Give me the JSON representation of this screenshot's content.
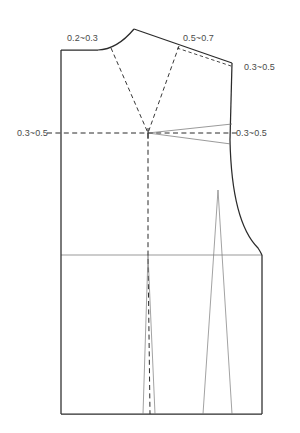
{
  "diagram": {
    "type": "sewing-pattern-technical-drawing",
    "units": "cm",
    "line_colors": {
      "outline": "#2b2b2b",
      "construction_dashed": "#2b2b2b",
      "dart_light": "#7a7a7a",
      "annotation_text": "#4a4a4a",
      "background": "#ffffff"
    }
  },
  "annotations": [
    {
      "id": "neck-shoulder-ease",
      "label": "0.2~0.3",
      "x": 67,
      "y": 41,
      "anchor": "start",
      "describes": "back neckline / shoulder adjustment amount"
    },
    {
      "id": "shoulder-dart-intake",
      "label": "0.5~0.7",
      "x": 183,
      "y": 41,
      "anchor": "start",
      "describes": "shoulder seam dart intake amount"
    },
    {
      "id": "shoulder-tip-drop",
      "label": "0.3~0.5",
      "x": 244,
      "y": 70,
      "anchor": "start",
      "describes": "shoulder tip lowering amount"
    },
    {
      "id": "left-bust-line-ease",
      "label": "0.3~0.5",
      "x": 17,
      "y": 136,
      "anchor": "start",
      "describes": "center front bust line adjustment"
    },
    {
      "id": "right-bust-dart-intake",
      "label": "0.3~0.5",
      "x": 236,
      "y": 136,
      "anchor": "start",
      "describes": "side seam bust dart intake"
    }
  ],
  "geometry": {
    "bodice_outline": "M 61,50 L 61,255 L 61,414 L 262,414 L 262,255",
    "center_back_x": 61,
    "waist_line_y": 255,
    "hem_line_y": 414,
    "right_side_x": 262,
    "shoulder_apex": {
      "x": 134,
      "y": 29
    },
    "shoulder_tip": {
      "x": 232,
      "y": 63
    },
    "bust_point": {
      "x": 148,
      "y": 133
    },
    "bust_line_y": 133,
    "neck_point_left": {
      "x": 61,
      "y": 50
    },
    "armhole_top": {
      "x": 230,
      "y": 140
    },
    "side_dart_apex": {
      "x": 218,
      "y": 190
    },
    "center_dart_top_y": 255,
    "center_dart_bottom_y": 414
  },
  "elements": [
    {
      "name": "center-back-edge",
      "kind": "solid-outline"
    },
    {
      "name": "back-neckline-curve",
      "kind": "solid-outline"
    },
    {
      "name": "shoulder-seam",
      "kind": "solid-outline"
    },
    {
      "name": "armhole-curve",
      "kind": "solid-outline"
    },
    {
      "name": "side-seam",
      "kind": "solid-outline"
    },
    {
      "name": "hem-line",
      "kind": "solid-outline"
    },
    {
      "name": "waist-line",
      "kind": "light-outline"
    },
    {
      "name": "neck-dart-leg",
      "kind": "dashed-construction"
    },
    {
      "name": "shoulder-dart-leg",
      "kind": "dashed-construction"
    },
    {
      "name": "bust-line-guide",
      "kind": "dashed-construction"
    },
    {
      "name": "center-vertical-guide",
      "kind": "dashed-construction"
    },
    {
      "name": "bust-dart-upper-leg",
      "kind": "light-outline"
    },
    {
      "name": "bust-dart-lower-leg",
      "kind": "light-outline"
    },
    {
      "name": "center-waist-dart",
      "kind": "light-dart"
    },
    {
      "name": "side-waist-dart",
      "kind": "light-dart"
    }
  ]
}
